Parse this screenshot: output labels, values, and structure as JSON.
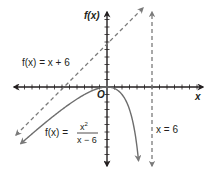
{
  "chart_data": {
    "type": "line",
    "title": "",
    "xlabel": "x",
    "ylabel": "f(x)",
    "origin_label": "O",
    "xlim": [
      -12.4,
      12.8
    ],
    "ylim": [
      -10.4,
      10
    ],
    "grid": false,
    "tick_spacing": 1,
    "series": [
      {
        "name": "f(x) = x^2/(x - 6)",
        "label_prefix": "f(x) =",
        "numerator": "x",
        "exponent": "2",
        "denominator": "x − 6",
        "style": "solid",
        "points": [
          [
            -11.5,
            -7.5
          ],
          [
            -10,
            -6.25
          ],
          [
            -8,
            -4.57
          ],
          [
            -6,
            -3
          ],
          [
            -4,
            -1.6
          ],
          [
            -2,
            -0.5
          ],
          [
            0,
            0
          ],
          [
            1,
            -0.2
          ],
          [
            2,
            -1
          ],
          [
            3,
            -3
          ],
          [
            3.5,
            -4.9
          ],
          [
            4,
            -8
          ],
          [
            4.25,
            -10.3
          ]
        ]
      },
      {
        "name": "f(x) = x + 6",
        "label": "f(x) = x + 6",
        "style": "dashed",
        "points": [
          [
            -12.4,
            -6.4
          ],
          [
            6.5,
            12.5
          ]
        ]
      },
      {
        "name": "x = 6",
        "label": "x = 6",
        "style": "dashed",
        "vertical_at": 6
      }
    ]
  }
}
